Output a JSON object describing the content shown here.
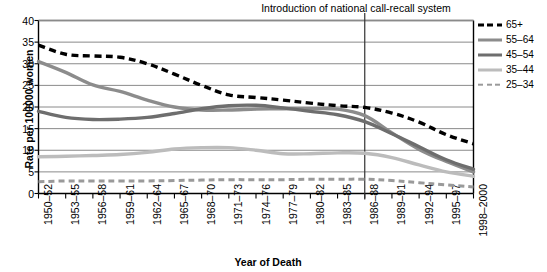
{
  "chart_data": {
    "type": "line",
    "title": "",
    "xlabel": "Year of Death",
    "ylabel": "Rate per 100000 women",
    "ylim": [
      0,
      40
    ],
    "ytick_values": [
      0,
      5,
      10,
      15,
      20,
      25,
      30,
      35,
      40
    ],
    "grid": "horizontal",
    "legend_position": "right",
    "categories": [
      "1950–52",
      "1953–55",
      "1956–58",
      "1959–61",
      "1962–64",
      "1965–67",
      "1968–70",
      "1971–73",
      "1974–76",
      "1977–79",
      "1980–82",
      "1983–85",
      "1986–88",
      "1989–91",
      "1992–94",
      "1995–97",
      "1998–2000"
    ],
    "series": [
      {
        "name": "65+",
        "style": "dashed",
        "color": "#000000",
        "width": 3.4,
        "values": [
          34.3,
          32.2,
          31.8,
          31.5,
          30.0,
          27.6,
          25.0,
          22.8,
          22.2,
          21.6,
          20.9,
          20.3,
          19.9,
          18.6,
          16.5,
          13.6,
          11.5
        ]
      },
      {
        "name": "55–64",
        "style": "solid",
        "color": "#8c8c8c",
        "width": 3.4,
        "values": [
          30.5,
          28.0,
          25.1,
          23.6,
          21.6,
          20.0,
          19.3,
          19.3,
          19.5,
          19.6,
          19.6,
          19.5,
          18.0,
          14.0,
          10.2,
          7.4,
          5.0
        ]
      },
      {
        "name": "45–54",
        "style": "solid",
        "color": "#6e6e6e",
        "width": 3.4,
        "values": [
          19.0,
          17.6,
          17.1,
          17.2,
          17.6,
          18.5,
          19.6,
          20.3,
          20.4,
          19.8,
          19.0,
          18.2,
          16.6,
          13.8,
          10.8,
          7.8,
          5.6
        ]
      },
      {
        "name": "35–44",
        "style": "solid",
        "color": "#bcbcbc",
        "width": 3.4,
        "values": [
          8.5,
          8.6,
          8.8,
          9.0,
          9.5,
          10.3,
          10.6,
          10.6,
          10.0,
          9.2,
          9.2,
          9.4,
          9.3,
          8.3,
          6.6,
          5.0,
          4.0
        ]
      },
      {
        "name": "25–34",
        "style": "dashed",
        "color": "#9a9a9a",
        "width": 3.0,
        "values": [
          2.7,
          2.9,
          2.9,
          2.9,
          2.9,
          3.0,
          3.1,
          3.2,
          3.2,
          3.2,
          3.3,
          3.3,
          3.3,
          3.0,
          2.5,
          2.0,
          1.5
        ]
      }
    ],
    "annotations": [
      {
        "text": "Introduction of national call-recall system",
        "at_category": "1986–88",
        "type": "vertical-line"
      }
    ]
  },
  "legend": {
    "items": [
      {
        "label": "65+",
        "swatch": "dashed-black"
      },
      {
        "label": "55–64",
        "swatch": "solid-medium-gray"
      },
      {
        "label": "45–54",
        "swatch": "solid-dark-gray"
      },
      {
        "label": "35–44",
        "swatch": "solid-light-gray"
      },
      {
        "label": "25–34",
        "swatch": "dashed-gray"
      }
    ]
  },
  "colors": {
    "axis": "#000000",
    "grid": "#8a8a8a",
    "background": "#ffffff",
    "annotation_line": "#333333"
  }
}
